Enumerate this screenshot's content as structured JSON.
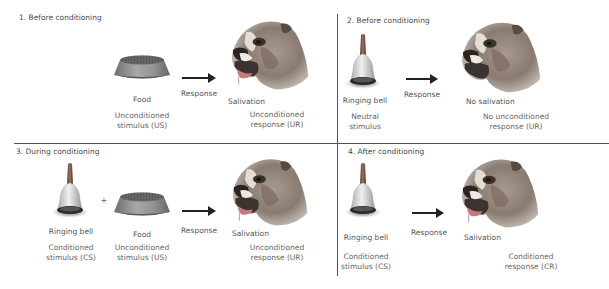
{
  "diagram": {
    "panels": [
      {
        "title": "1. Before conditioning",
        "items": [
          {
            "icon": "food-bowl",
            "label": "Food",
            "role": "Unconditioned\nstimulus (US)",
            "role_line1": "Unconditioned",
            "role_line2": "stimulus (US)"
          }
        ],
        "arrow_label": "Response",
        "result": {
          "icon": "dog-salivating",
          "label": "Salivation",
          "role_line1": "Unconditioned",
          "role_line2": "response (UR)"
        }
      },
      {
        "title": "2. Before conditioning",
        "items": [
          {
            "icon": "ringing-bell",
            "label": "Ringing bell",
            "role_line1": "Neutral",
            "role_line2": "stimulus"
          }
        ],
        "arrow_label": "Response",
        "result": {
          "icon": "dog",
          "label": "No salivation",
          "role_line1": "No unconditioned",
          "role_line2": "response (UR)"
        }
      },
      {
        "title": "3. During conditioning",
        "items": [
          {
            "icon": "ringing-bell",
            "label": "Ringing bell",
            "role_line1": "Conditioned",
            "role_line2": "stimulus (CS)"
          },
          {
            "icon": "food-bowl",
            "label": "Food",
            "role_line1": "Unconditioned",
            "role_line2": "stimulus (US)"
          }
        ],
        "plus": "+",
        "arrow_label": "Response",
        "result": {
          "icon": "dog-salivating",
          "label": "Salivation",
          "role_line1": "Unconditioned",
          "role_line2": "response (UR)"
        }
      },
      {
        "title": "4. After conditioning",
        "items": [
          {
            "icon": "ringing-bell",
            "label": "Ringing bell",
            "role_line1": "Conditioned",
            "role_line2": "stimulus (CS)"
          }
        ],
        "arrow_label": "Response",
        "result": {
          "icon": "dog-salivating",
          "label": "Salivation",
          "role_line1": "Conditioned",
          "role_line2": "response (CR)"
        }
      }
    ],
    "colors": {
      "text": "#555555",
      "divider": "#555555",
      "arrow": "#222222",
      "dog_fur": "#8a7a6e",
      "bowl": "#8c8c8c"
    }
  }
}
